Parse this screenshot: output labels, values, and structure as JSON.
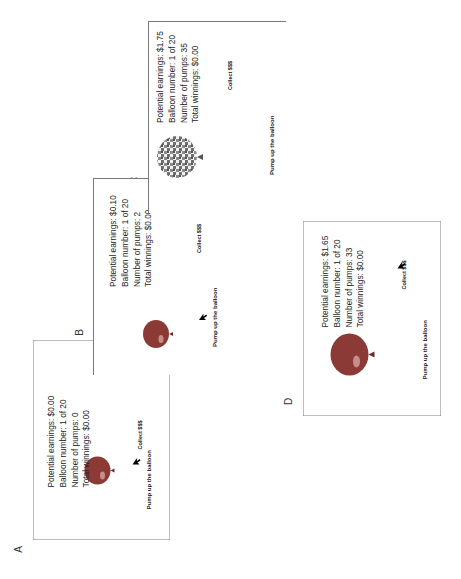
{
  "figure": {
    "orientation": "rotated 90 degrees counter-clockwise",
    "panels": [
      {
        "label": "A",
        "potential_earnings": "Potential earnings: $0.00",
        "balloon_number": "Balloon number: 1 of 20",
        "number_of_pumps": "Number of pumps: 0",
        "total_winnings": "Total winnings: $0.00",
        "collect_button": "Collect $$$",
        "pump_button": "Pump up the balloon",
        "balloon_state": "small",
        "cursor_on": "pump"
      },
      {
        "label": "B",
        "potential_earnings": "Potential earnings: $0.10",
        "balloon_number": "Balloon number: 1 of 20",
        "number_of_pumps": "Number of pumps: 2",
        "total_winnings": "Total winnings: $0.00",
        "collect_button": "Collect $$$",
        "pump_button": "Pump up the balloon",
        "balloon_state": "small",
        "cursor_on": "pump"
      },
      {
        "label": "C",
        "potential_earnings": "Potential earnings: $1.75",
        "balloon_number": "Balloon number: 1 of 20",
        "number_of_pumps": "Number of pumps: 35",
        "total_winnings": "Total winnings: $0.00",
        "collect_button": "Collect $$$",
        "pump_button": "Pump up the balloon",
        "balloon_state": "exploded",
        "cursor_on": "none"
      },
      {
        "label": "D",
        "potential_earnings": "Potential earnings: $1.65",
        "balloon_number": "Balloon number: 1 of 20",
        "number_of_pumps": "Number of pumps: 33",
        "total_winnings": "Total winnings: $0.00",
        "collect_button": "Collect $$$",
        "pump_button": "Pump up the balloon",
        "balloon_state": "large",
        "cursor_on": "collect"
      }
    ],
    "colors": {
      "balloon": "#8c3a36",
      "balloon_highlight": "#d7a39d",
      "border": "#7a7a7a",
      "text": "#222222"
    }
  }
}
